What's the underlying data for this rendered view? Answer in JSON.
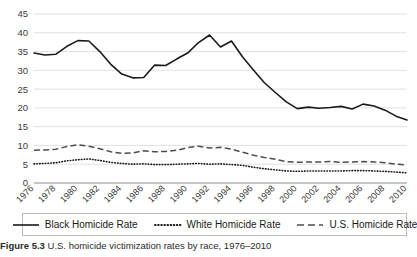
{
  "figure": {
    "caption_label": "Figure 5.3",
    "caption_text": "U.S. homicide victimization rates by race, 1976–2010"
  },
  "legend": {
    "position": "bottom",
    "items": [
      {
        "label": "Black Homicide Rate",
        "style": "solid",
        "color": "#1a1a1a"
      },
      {
        "label": "White Homicide Rate",
        "style": "dotted",
        "color": "#1a1a1a"
      },
      {
        "label": "U.S. Homicide Rate",
        "style": "dashed",
        "color": "#4d4d4d"
      }
    ]
  },
  "axes": {
    "y_ticks": [
      "0",
      "5",
      "10",
      "15",
      "20",
      "25",
      "30",
      "35",
      "40",
      "45"
    ],
    "x_ticks": [
      "1976",
      "1978",
      "1980",
      "1982",
      "1984",
      "1986",
      "1988",
      "1990",
      "1992",
      "1994",
      "1996",
      "1998",
      "2000",
      "2002",
      "2004",
      "2006",
      "2008",
      "2010"
    ]
  },
  "chart_data": {
    "type": "line",
    "title": "",
    "subtitle": "",
    "xlabel": "",
    "ylabel": "",
    "xlim": [
      1976,
      2010
    ],
    "ylim": [
      0,
      45
    ],
    "grid": true,
    "legend_position": "bottom",
    "x": [
      1976,
      1977,
      1978,
      1979,
      1980,
      1981,
      1982,
      1983,
      1984,
      1985,
      1986,
      1987,
      1988,
      1989,
      1990,
      1991,
      1992,
      1993,
      1994,
      1995,
      1996,
      1997,
      1998,
      1999,
      2000,
      2001,
      2002,
      2003,
      2004,
      2005,
      2006,
      2007,
      2008,
      2009,
      2010
    ],
    "series": [
      {
        "name": "Black Homicide Rate",
        "style": "solid",
        "values": [
          34.6,
          34.1,
          34.3,
          36.4,
          37.9,
          37.8,
          35.0,
          31.6,
          29.0,
          28.0,
          28.1,
          31.4,
          31.3,
          33.0,
          34.6,
          37.4,
          39.4,
          36.2,
          37.8,
          33.6,
          30.1,
          26.7,
          24.1,
          21.6,
          19.8,
          20.2,
          19.9,
          20.1,
          20.4,
          19.7,
          21.0,
          20.5,
          19.4,
          17.8,
          16.8
        ]
      },
      {
        "name": "White Homicide Rate",
        "style": "dotted",
        "values": [
          5.1,
          5.2,
          5.4,
          5.9,
          6.2,
          6.4,
          6.0,
          5.5,
          5.2,
          5.0,
          5.1,
          4.9,
          4.9,
          5.0,
          5.1,
          5.2,
          5.0,
          5.1,
          4.9,
          4.7,
          4.2,
          3.8,
          3.5,
          3.2,
          3.1,
          3.2,
          3.2,
          3.2,
          3.2,
          3.3,
          3.3,
          3.2,
          3.1,
          2.9,
          2.7
        ]
      },
      {
        "name": "U.S. Homicide Rate",
        "style": "dashed",
        "values": [
          8.7,
          8.8,
          9.0,
          9.7,
          10.2,
          9.8,
          9.1,
          8.3,
          7.9,
          8.0,
          8.6,
          8.3,
          8.4,
          8.7,
          9.4,
          9.8,
          9.3,
          9.5,
          9.0,
          8.2,
          7.4,
          6.8,
          6.3,
          5.7,
          5.5,
          5.6,
          5.6,
          5.7,
          5.5,
          5.6,
          5.7,
          5.6,
          5.4,
          5.0,
          4.8
        ]
      }
    ]
  }
}
